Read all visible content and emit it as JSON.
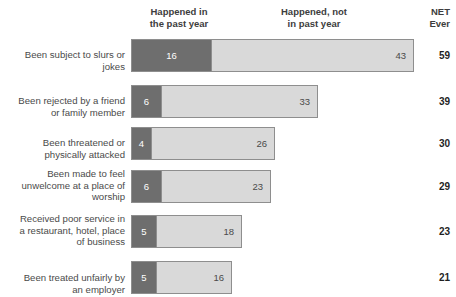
{
  "header": {
    "col_recent": "Happened in\nthe past year",
    "col_past": "Happened, not\nin past year",
    "col_net": "NET\nEver"
  },
  "colors": {
    "recent": "#6e6e6e",
    "past": "#d9d9d9",
    "border": "#8e8e8e",
    "text": "#3d3d3d",
    "net_text": "#1f1f1f",
    "background": "#ffffff"
  },
  "chart_data": {
    "type": "bar",
    "title": "",
    "xlabel": "",
    "ylabel": "",
    "stacked": true,
    "orientation": "horizontal",
    "grid": false,
    "legend_position": "top",
    "xlim": [
      0,
      59
    ],
    "categories": [
      "Been subject to slurs or\njokes",
      "Been rejected by a friend\nor family member",
      "Been threatened or\nphysically attacked",
      "Been made to feel\nunwelcome at a place of\nworship",
      "Received poor service in\na restaurant, hotel, place\nof business",
      "Been treated unfairly by\nan employer"
    ],
    "series": [
      {
        "name": "Happened in the past year",
        "values": [
          16,
          6,
          4,
          6,
          5,
          5
        ]
      },
      {
        "name": "Happened, not in past year",
        "values": [
          43,
          33,
          26,
          23,
          18,
          16
        ]
      }
    ],
    "net_label": "NET Ever",
    "net_values": [
      59,
      39,
      30,
      29,
      23,
      21
    ]
  },
  "rows": [
    {
      "label": "Been subject to slurs or\njokes",
      "recent": "16",
      "past": "43",
      "net": "59",
      "recent_w": 80,
      "past_w": 203,
      "top": 3,
      "label_top": 5,
      "block_h": 46
    },
    {
      "label": "Been rejected by a friend\nor family member",
      "recent": "6",
      "past": "33",
      "net": "39",
      "recent_w": 30,
      "past_w": 157,
      "top": 3,
      "label_top": 5,
      "block_h": 42
    },
    {
      "label": "Been threatened or\nphysically attacked",
      "recent": "4",
      "past": "26",
      "net": "30",
      "recent_w": 20,
      "past_w": 124,
      "top": 3,
      "label_top": 5,
      "block_h": 42
    },
    {
      "label": "Been made to feel\nunwelcome at a place of\nworship",
      "recent": "6",
      "past": "23",
      "net": "29",
      "recent_w": 30,
      "past_w": 110,
      "top": 4,
      "label_top": -1,
      "block_h": 45
    },
    {
      "label": "Received poor service in\na restaurant, hotel, place\nof business",
      "recent": "5",
      "past": "18",
      "net": "23",
      "recent_w": 25,
      "past_w": 86,
      "top": 4,
      "label_top": -1,
      "block_h": 46
    },
    {
      "label": "Been treated unfairly by\nan employer",
      "recent": "5",
      "past": "16",
      "net": "21",
      "recent_w": 25,
      "past_w": 76,
      "top": 4,
      "label_top": 6,
      "block_h": 42
    }
  ]
}
